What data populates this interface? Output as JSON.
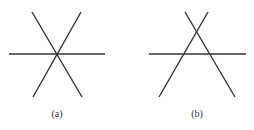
{
  "panels": [
    {
      "label": "(a)",
      "label_pos": {
        "x": 57,
        "y": 108
      },
      "lines": [
        {
          "x1": 9,
          "y1": 54,
          "x2": 105,
          "y2": 54
        },
        {
          "x1": 32,
          "y1": 12,
          "x2": 82,
          "y2": 97
        },
        {
          "x1": 81,
          "y1": 12,
          "x2": 33,
          "y2": 97
        }
      ]
    },
    {
      "label": "(b)",
      "label_pos": {
        "x": 197,
        "y": 108
      },
      "lines": [
        {
          "x1": 149,
          "y1": 54,
          "x2": 246,
          "y2": 54
        },
        {
          "x1": 185,
          "y1": 12,
          "x2": 235,
          "y2": 97
        },
        {
          "x1": 208,
          "y1": 12,
          "x2": 159,
          "y2": 97
        }
      ]
    }
  ],
  "colors": {
    "stroke": "#333333",
    "background": "#ffffff"
  }
}
